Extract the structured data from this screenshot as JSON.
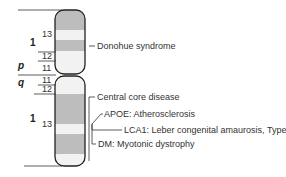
{
  "diagram": {
    "type": "chromosome-ideogram",
    "arms": {
      "p": {
        "label": "p",
        "region": "1",
        "bands": [
          "13",
          "12",
          "11"
        ]
      },
      "q": {
        "label": "q",
        "region": "1",
        "bands": [
          "11",
          "12",
          "13"
        ]
      }
    },
    "colors": {
      "dark_band": "#bdbdbd",
      "light_band": "#f2f2f2",
      "outline": "#222222",
      "text": "#333333"
    },
    "annotations": [
      {
        "id": "donohue",
        "text": "Donohue syndrome",
        "arm": "p"
      },
      {
        "id": "central-core",
        "text": "Central core disease",
        "arm": "q"
      },
      {
        "id": "apoe",
        "text": "APOE: Atherosclerosis",
        "arm": "q"
      },
      {
        "id": "lca1",
        "text": "LCA1: Leber congenital amaurosis, Type 1",
        "arm": "q"
      },
      {
        "id": "dm",
        "text": "DM: Myotonic dystrophy",
        "arm": "q"
      }
    ]
  }
}
